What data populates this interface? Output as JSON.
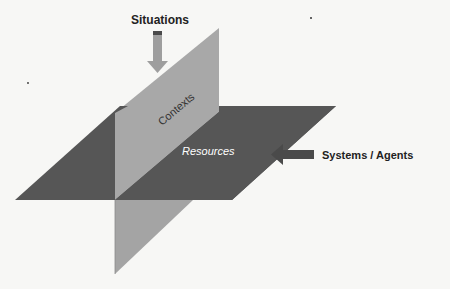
{
  "diagram": {
    "type": "intersecting-planes",
    "labels": {
      "situations": "Situations",
      "contexts": "Contexts",
      "resources": "Resources",
      "systems_agents": "Systems / Agents"
    },
    "colors": {
      "background": "#f7f7f5",
      "resources_plane": "#555555",
      "contexts_plane": "#a6a6a6",
      "contexts_plane_lower": "#a0a0a0",
      "arrow_situations": "#9e9e9e",
      "arrow_systems": "#4a4a4a",
      "text_dark": "#222222",
      "text_on_plane": "#ffffff"
    }
  }
}
